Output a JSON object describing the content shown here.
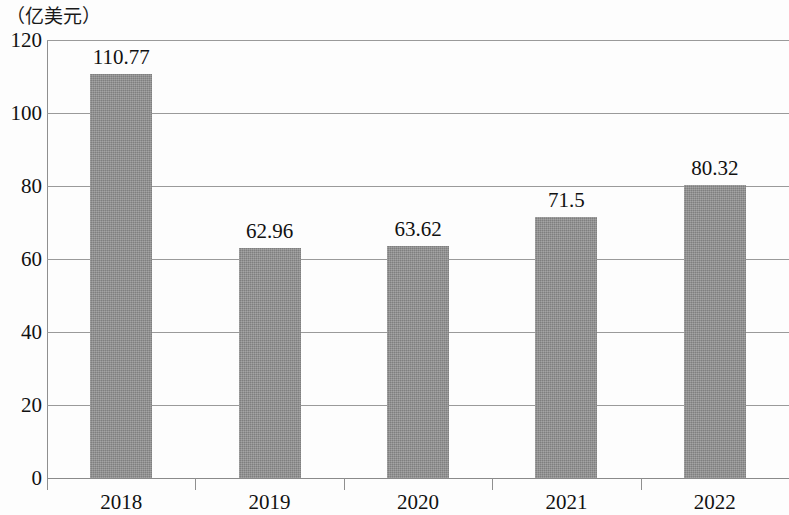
{
  "chart_data": {
    "type": "bar",
    "title": "（亿美元）",
    "subtitle": "",
    "xlabel": "",
    "ylabel": "（亿美元）",
    "categories": [
      "2018",
      "2019",
      "2020",
      "2021",
      "2022"
    ],
    "values": [
      110.77,
      62.96,
      63.62,
      71.5,
      80.32
    ],
    "value_labels": [
      "110.77",
      "62.96",
      "63.62",
      "71.5",
      "80.32"
    ],
    "series": [
      {
        "name": "金额",
        "values": [
          110.77,
          62.96,
          63.62,
          71.5,
          80.32
        ]
      }
    ],
    "ylim": [
      0,
      120
    ],
    "ytick_values": [
      0,
      20,
      40,
      60,
      80,
      100,
      120
    ],
    "ytick_labels": [
      "0",
      "20",
      "40",
      "60",
      "80",
      "100",
      "120"
    ],
    "grid": true,
    "grid_axis": "y",
    "legend": false,
    "legend_position": "none",
    "bar_color": "#8d8d8d",
    "grid_color": "#9a9a9a",
    "axis_color": "#8f8f8f",
    "text_color": "#111111"
  }
}
